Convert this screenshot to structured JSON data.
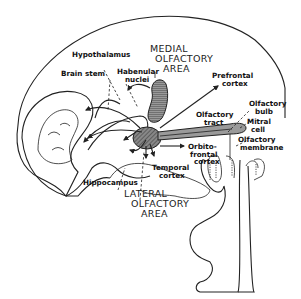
{
  "figure": {
    "areas": {
      "medial": [
        "MEDIAL",
        "OLFACTORY",
        "AREA"
      ],
      "lateral": [
        "LATERAL",
        "OLFACTORY",
        "AREA"
      ]
    },
    "labels": {
      "hypothalamus": "Hypothalamus",
      "brain_stem": "Brain stem",
      "habenular_1": "Habenular",
      "habenular_2": "nuclei",
      "prefrontal_1": "Prefrontal",
      "prefrontal_2": "cortex",
      "olfactory_tract_1": "Olfactory",
      "olfactory_tract_2": "tract",
      "olfactory_bulb_1": "Olfactory",
      "olfactory_bulb_2": "bulb",
      "mitral_1": "Mitral",
      "mitral_2": "cell",
      "olfactory_membrane_1": "Olfactory",
      "olfactory_membrane_2": "membrane",
      "orbitofrontal_1": "Orbito-",
      "orbitofrontal_2": "frontal",
      "orbitofrontal_3": "cortex",
      "temporal_1": "Temporal",
      "temporal_2": "cortex",
      "hippocampus": "Hippocampus"
    },
    "colors": {
      "ink": "#222222",
      "shade": "#777777",
      "tract": "#999999",
      "background": "#ffffff"
    }
  }
}
